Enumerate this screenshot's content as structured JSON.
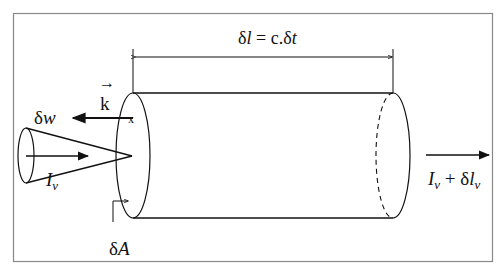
{
  "diagram": {
    "type": "radiative transfer through a cylindrical volume element",
    "labels": {
      "length": {
        "delta": "δ",
        "l": "l",
        "eq": " = c.",
        "delta2": "δ",
        "t": "t"
      },
      "wavevector": {
        "arrow": "→",
        "k": "k"
      },
      "solid_angle": {
        "delta": "δ",
        "w": "w"
      },
      "intensity_in": {
        "I": "I",
        "sub": "v"
      },
      "area": {
        "delta": "δ",
        "A": "A"
      },
      "intensity_out": {
        "I": "I",
        "sub": "v",
        "plus": " + δ",
        "l": "l",
        "sub2": "v"
      }
    },
    "colors": {
      "stroke": "#111111",
      "frame": "#888888",
      "background": "#ffffff"
    }
  }
}
